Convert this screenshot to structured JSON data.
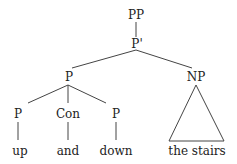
{
  "tree": {
    "root": "PP",
    "bar": "P'",
    "left": "P",
    "right": "NP",
    "children": [
      {
        "cat": "P",
        "word": "up"
      },
      {
        "cat": "Con",
        "word": "and"
      },
      {
        "cat": "P",
        "word": "down"
      }
    ],
    "np_words": "the stairs"
  }
}
